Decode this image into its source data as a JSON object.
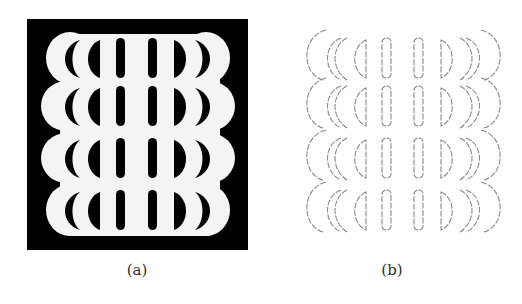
{
  "figure": {
    "panels": [
      {
        "id": "a",
        "caption": "(a)",
        "description": "Binary image: white stacked bump shape on black square with black crescent and bar cutouts"
      },
      {
        "id": "b",
        "caption": "(b)",
        "description": "Edge map of panel (a): thin gray contour lines"
      }
    ],
    "colors": {
      "background": "#ffffff",
      "ink": "#000000",
      "edge": "#8a8a8a"
    },
    "rows": 4
  }
}
